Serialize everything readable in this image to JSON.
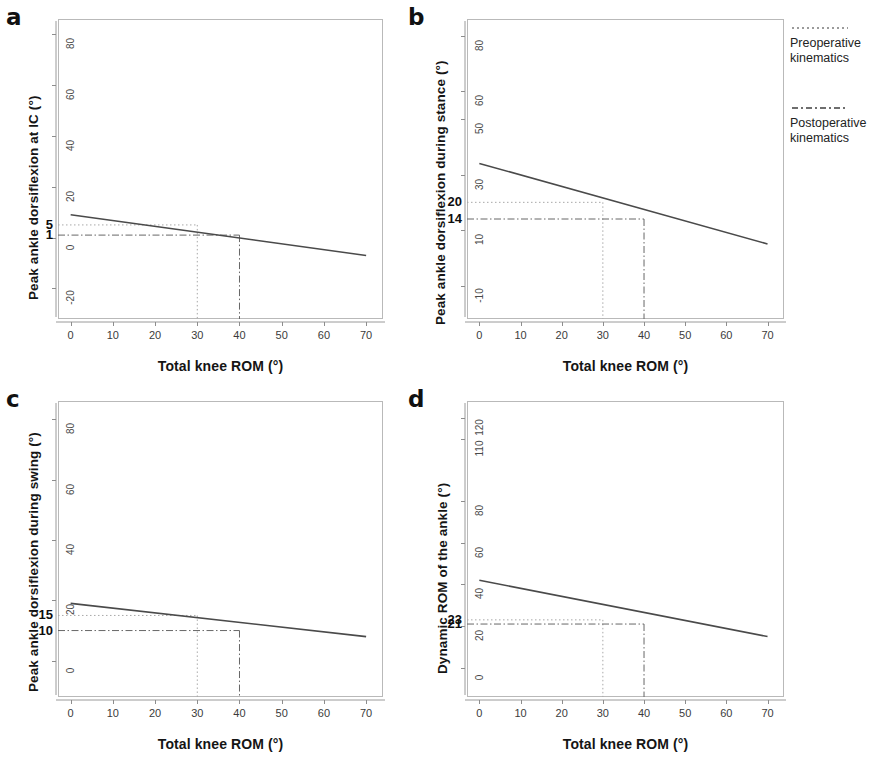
{
  "figure": {
    "xlabel": "Total knee ROM (°)",
    "x_ticks": [
      "0",
      "10",
      "20",
      "30",
      "40",
      "50",
      "60",
      "70"
    ]
  },
  "legend": {
    "items": [
      {
        "label_line1": "Preoperative",
        "label_line2": "kinematics",
        "style": "dotted",
        "color": "#9b9b9b"
      },
      {
        "label_line1": "Postoperative",
        "label_line2": "kinematics",
        "style": "dashdot",
        "color": "#5e5e5e"
      }
    ]
  },
  "panels": {
    "a": {
      "letter": "a",
      "ylabel": "Peak ankle dorsiflexion at IC (°)",
      "y_ticks": [
        "-20",
        "0",
        "20",
        "40",
        "60",
        "80"
      ],
      "pre_value": "5",
      "post_value": "1"
    },
    "b": {
      "letter": "b",
      "ylabel": "Peak ankle dorsiflexion during stance (°)",
      "y_ticks": [
        "-10",
        "10",
        "30",
        "50",
        "60",
        "80"
      ],
      "pre_value": "20",
      "post_value": "14"
    },
    "c": {
      "letter": "c",
      "ylabel": "Peak ankle dorsiflexion during swing (°)",
      "y_ticks": [
        "0",
        "20",
        "40",
        "60",
        "80"
      ],
      "pre_value": "15",
      "post_value": "10"
    },
    "d": {
      "letter": "d",
      "ylabel": "Dynamic ROM of the ankle (°)",
      "y_ticks": [
        "0",
        "20",
        "40",
        "60",
        "80",
        "110",
        "120"
      ],
      "pre_value": "23",
      "post_value": "21"
    }
  },
  "chart_data": [
    {
      "id": "a",
      "type": "line",
      "title": "a",
      "xlabel": "Total knee ROM (°)",
      "ylabel": "Peak ankle dorsiflexion at IC (°)",
      "xlim": [
        -3,
        74
      ],
      "ylim": [
        -32,
        86
      ],
      "xticks": [
        0,
        10,
        20,
        30,
        40,
        50,
        60,
        70
      ],
      "yticks": [
        -20,
        0,
        20,
        40,
        60,
        80
      ],
      "grid": false,
      "series": [
        {
          "name": "regression line",
          "x": [
            0,
            70
          ],
          "y": [
            9,
            -7
          ]
        }
      ],
      "annotations": [
        {
          "name": "preoperative",
          "x": 30,
          "y": 5,
          "label": "5",
          "style": "dotted"
        },
        {
          "name": "postoperative",
          "x": 40,
          "y": 1,
          "label": "1",
          "style": "dashdot"
        }
      ]
    },
    {
      "id": "b",
      "type": "line",
      "title": "b",
      "xlabel": "Total knee ROM (°)",
      "ylabel": "Peak ankle dorsiflexion during stance (°)",
      "xlim": [
        -3,
        74
      ],
      "ylim": [
        -22,
        86
      ],
      "xticks": [
        0,
        10,
        20,
        30,
        40,
        50,
        60,
        70
      ],
      "yticks": [
        -10,
        10,
        30,
        50,
        60,
        80
      ],
      "grid": false,
      "series": [
        {
          "name": "regression line",
          "x": [
            0,
            70
          ],
          "y": [
            34,
            5
          ]
        }
      ],
      "annotations": [
        {
          "name": "preoperative",
          "x": 30,
          "y": 20,
          "label": "20",
          "style": "dotted"
        },
        {
          "name": "postoperative",
          "x": 40,
          "y": 14,
          "label": "14",
          "style": "dashdot"
        }
      ]
    },
    {
      "id": "c",
      "type": "line",
      "title": "c",
      "xlabel": "Total knee ROM (°)",
      "ylabel": "Peak ankle dorsiflexion during swing (°)",
      "xlim": [
        -3,
        74
      ],
      "ylim": [
        -12,
        86
      ],
      "xticks": [
        0,
        10,
        20,
        30,
        40,
        50,
        60,
        70
      ],
      "yticks": [
        0,
        20,
        40,
        60,
        80
      ],
      "grid": false,
      "series": [
        {
          "name": "regression line",
          "x": [
            0,
            70
          ],
          "y": [
            19,
            8
          ]
        }
      ],
      "annotations": [
        {
          "name": "preoperative",
          "x": 30,
          "y": 15,
          "label": "15",
          "style": "dotted"
        },
        {
          "name": "postoperative",
          "x": 40,
          "y": 10,
          "label": "10",
          "style": "dashdot"
        }
      ]
    },
    {
      "id": "d",
      "type": "line",
      "title": "d",
      "xlabel": "Total knee ROM (°)",
      "ylabel": "Dynamic ROM of the ankle (°)",
      "xlim": [
        -3,
        74
      ],
      "ylim": [
        -14,
        128
      ],
      "xticks": [
        0,
        10,
        20,
        30,
        40,
        50,
        60,
        70
      ],
      "yticks": [
        0,
        20,
        40,
        60,
        80,
        110,
        120
      ],
      "grid": false,
      "series": [
        {
          "name": "regression line",
          "x": [
            0,
            70
          ],
          "y": [
            42,
            15
          ]
        }
      ],
      "annotations": [
        {
          "name": "preoperative",
          "x": 30,
          "y": 23,
          "label": "23",
          "style": "dotted"
        },
        {
          "name": "postoperative",
          "x": 40,
          "y": 21,
          "label": "21",
          "style": "dashdot"
        }
      ]
    }
  ]
}
